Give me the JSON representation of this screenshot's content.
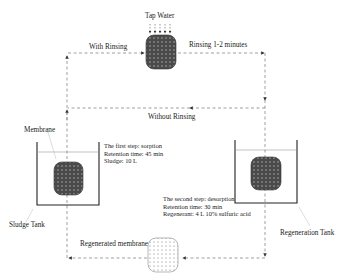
{
  "diagram": {
    "top": {
      "input_label": "Tap Water",
      "left_branch_label": "With Rinsing",
      "right_branch_label": "Rinsing 1-2 minutes"
    },
    "middle": {
      "bypass_label": "Without Rinsing"
    },
    "sludge_tank": {
      "title": "Sludge Tank",
      "membrane_label": "Membrane",
      "step_lines": [
        "The first step: sorption",
        "Retention time: 45 min",
        "Sludge: 10 L"
      ]
    },
    "regeneration_tank": {
      "title": "Regeneration Tank",
      "step_lines": [
        "The second step: desorption",
        "Retention time: 30 min",
        "Regenerant: 4 L 10% sulfuric acid"
      ]
    },
    "bottom": {
      "regenerated_label": "Regenerated membrane"
    },
    "colors": {
      "membrane_fill": "#4a4a4a",
      "line": "#666666",
      "tank": "#222222",
      "water_line": "#999999"
    }
  }
}
